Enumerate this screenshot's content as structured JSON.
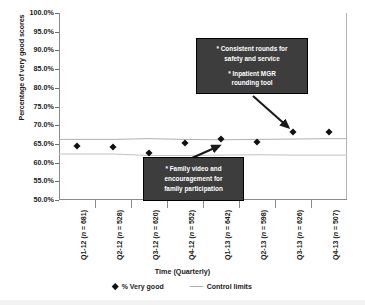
{
  "chart_data": {
    "type": "scatter",
    "title": "",
    "xlabel": "Time (Quarterly)",
    "ylabel": "Percentage of very good scores",
    "ylim": [
      50.0,
      100.0
    ],
    "ytick_labels": [
      "100.0%",
      "95.0%",
      "90.0%",
      "85.0%",
      "80.0%",
      "75.0%",
      "70.0%",
      "65.0%",
      "60.0%",
      "55.0%",
      "50.0%"
    ],
    "ytick_values": [
      100.0,
      95.0,
      90.0,
      85.0,
      80.0,
      75.0,
      70.0,
      65.0,
      60.0,
      55.0,
      50.0
    ],
    "grid": false,
    "legend_position": "bottom",
    "categories": [
      "Q1-12 (n = 681)",
      "Q2-12 (n = 528)",
      "Q3-12 (n = 620)",
      "Q4-12 (n = 552)",
      "Q1-13 (n = 642)",
      "Q2-13 (n = 598)",
      "Q3-13 (n = 626)",
      "Q4-13 (n = 507)"
    ],
    "category_parts": [
      {
        "quarter": "Q1-12",
        "n_label": "(n = 681)",
        "n": 681
      },
      {
        "quarter": "Q2-12",
        "n_label": "(n = 528)",
        "n": 528
      },
      {
        "quarter": "Q3-12",
        "n_label": "(n = 620)",
        "n": 620
      },
      {
        "quarter": "Q4-12",
        "n_label": "(n = 552)",
        "n": 552
      },
      {
        "quarter": "Q1-13",
        "n_label": "(n = 642)",
        "n": 642
      },
      {
        "quarter": "Q2-13",
        "n_label": "(n = 598)",
        "n": 598
      },
      {
        "quarter": "Q3-13",
        "n_label": "(n = 626)",
        "n": 626
      },
      {
        "quarter": "Q4-13",
        "n_label": "(n = 507)",
        "n": 507
      }
    ],
    "series": [
      {
        "name": "% Very good",
        "type": "scatter",
        "marker": "diamond",
        "color": "#111111",
        "values": [
          64.5,
          64.2,
          62.6,
          65.3,
          66.3,
          65.6,
          68.2,
          68.2
        ]
      },
      {
        "name": "Upper control limit",
        "type": "line",
        "color": "#b0b0b0",
        "values": [
          66.2,
          66.2,
          66.4,
          66.2,
          66.1,
          66.2,
          66.3,
          66.4
        ]
      },
      {
        "name": "Lower control limit",
        "type": "line",
        "color": "#b0b0b0",
        "values": [
          62.3,
          62.3,
          61.9,
          61.9,
          62.0,
          62.1,
          62.0,
          62.0
        ]
      }
    ],
    "legend": [
      {
        "label": "% Very good",
        "marker": "diamond",
        "color": "#111111"
      },
      {
        "label": "Control limits",
        "marker": "line",
        "color": "#b0b0b0"
      }
    ],
    "annotations": [
      {
        "id": "rounds",
        "lines": [
          "* Consistent rounds for safety and service",
          "* Inpatient MGR rounding tool"
        ],
        "points_to_category": "Q3-13",
        "background": "#3d3d3d",
        "text_color": "#ffffff"
      },
      {
        "id": "family",
        "lines": [
          "* Family video and encouragement for family participation"
        ],
        "points_to_category": "Q2-13",
        "background": "#3d3d3d",
        "text_color": "#ffffff"
      }
    ]
  },
  "axes": {
    "y_title": "Percentage of very good scores",
    "x_title": "Time (Quarterly)"
  },
  "legend": {
    "very_good": "% Very good",
    "control_limits": "Control limits"
  },
  "annotations": {
    "rounds_line1": "* Consistent rounds for",
    "rounds_line2": "safety and service",
    "rounds_line3": "* Inpatient MGR",
    "rounds_line4": "rounding tool",
    "family_line1": "* Family video and",
    "family_line2": "encouragement for",
    "family_line3": "family participation"
  }
}
